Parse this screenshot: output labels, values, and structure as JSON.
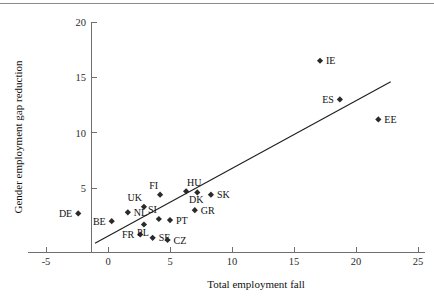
{
  "chart_data": {
    "type": "scatter",
    "title": "",
    "xlabel": "Total employment fall",
    "ylabel": "Gender employment gap reduction",
    "xlim": [
      -5,
      25
    ],
    "ylim": [
      -1.2,
      20
    ],
    "xticks": [
      -5,
      0,
      5,
      10,
      15,
      20,
      25
    ],
    "xtick_labels": [
      "-5",
      "0",
      "5",
      "10",
      "15",
      "20",
      "25"
    ],
    "yticks": [
      5,
      10,
      15,
      20
    ],
    "ytick_labels": [
      "5",
      "10",
      "15",
      "20"
    ],
    "grid": false,
    "legend": "none",
    "marker_style": "diamond",
    "points": [
      {
        "label": "DE",
        "x": -2.4,
        "y": 2.7,
        "label_side": "left"
      },
      {
        "label": "BE",
        "x": 0.3,
        "y": 2.0,
        "label_side": "left"
      },
      {
        "label": "FR",
        "x": 2.6,
        "y": 0.8,
        "label_side": "left"
      },
      {
        "label": "NL",
        "x": 1.6,
        "y": 2.8,
        "label_side": "right"
      },
      {
        "label": "UK",
        "x": 2.9,
        "y": 3.3,
        "label_side": "above-left"
      },
      {
        "label": "PL",
        "x": 2.9,
        "y": 1.7,
        "label_side": "below"
      },
      {
        "label": "SE",
        "x": 3.6,
        "y": 0.5,
        "label_side": "right"
      },
      {
        "label": "CZ",
        "x": 4.8,
        "y": 0.3,
        "label_side": "right"
      },
      {
        "label": "SI",
        "x": 4.1,
        "y": 2.2,
        "label_side": "above-left"
      },
      {
        "label": "FI",
        "x": 4.2,
        "y": 4.4,
        "label_side": "above-left"
      },
      {
        "label": "PT",
        "x": 5.0,
        "y": 2.1,
        "label_side": "right"
      },
      {
        "label": "HU",
        "x": 6.3,
        "y": 4.7,
        "label_side": "above-right"
      },
      {
        "label": "DK",
        "x": 7.2,
        "y": 4.6,
        "label_side": "below"
      },
      {
        "label": "GR",
        "x": 7.0,
        "y": 3.0,
        "label_side": "right"
      },
      {
        "label": "SK",
        "x": 8.3,
        "y": 4.4,
        "label_side": "right"
      },
      {
        "label": "IE",
        "x": 17.1,
        "y": 16.5,
        "label_side": "right"
      },
      {
        "label": "ES",
        "x": 18.7,
        "y": 13.0,
        "label_side": "left"
      },
      {
        "label": "EE",
        "x": 21.8,
        "y": 11.2,
        "label_side": "right"
      }
    ],
    "trend_line": {
      "x_start": -1.05,
      "y_start": 0.0,
      "x_end": 22.8,
      "y_end": 14.6
    }
  }
}
